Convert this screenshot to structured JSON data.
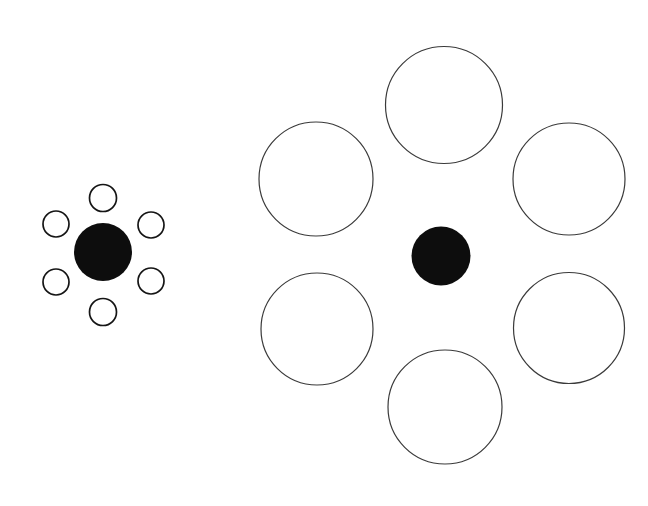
{
  "figure": {
    "name": "ebbinghaus-illusion",
    "canvas": {
      "width": 648,
      "height": 506
    },
    "colors": {
      "background": "#ffffff",
      "target_fill": "#0d0d0d",
      "inducer_stroke_small": "#151515",
      "inducer_stroke_large": "#3a3a3a",
      "inducer_fill": "#ffffff"
    },
    "stroke_widths": {
      "small_inducer": 1.7,
      "large_inducer": 1.2
    }
  },
  "groups": [
    {
      "id": "left-group",
      "label": "Target surrounded by small circles",
      "target": {
        "label": "left-target-circle",
        "cx": 103,
        "cy": 252,
        "r": 29,
        "fill": "#0d0d0d"
      },
      "inducers": [
        {
          "label": "top",
          "cx": 103,
          "cy": 198,
          "r": 13.5
        },
        {
          "label": "upper-right",
          "cx": 151,
          "cy": 225,
          "r": 13.0
        },
        {
          "label": "lower-right",
          "cx": 151,
          "cy": 281,
          "r": 13.0
        },
        {
          "label": "bottom",
          "cx": 103,
          "cy": 312,
          "r": 13.5
        },
        {
          "label": "lower-left",
          "cx": 56,
          "cy": 282,
          "r": 13.0
        },
        {
          "label": "upper-left",
          "cx": 56,
          "cy": 224,
          "r": 13.0
        }
      ]
    },
    {
      "id": "right-group",
      "label": "Target surrounded by large circles",
      "target": {
        "label": "right-target-circle",
        "cx": 441,
        "cy": 256,
        "r": 29.5,
        "fill": "#0d0d0d"
      },
      "inducers": [
        {
          "label": "top",
          "cx": 444,
          "cy": 105,
          "r": 58.5
        },
        {
          "label": "upper-right",
          "cx": 569,
          "cy": 179,
          "r": 56.0
        },
        {
          "label": "lower-right",
          "cx": 569,
          "cy": 328,
          "r": 55.5
        },
        {
          "label": "bottom",
          "cx": 445,
          "cy": 407,
          "r": 57.0
        },
        {
          "label": "lower-left",
          "cx": 317,
          "cy": 329,
          "r": 56.0
        },
        {
          "label": "upper-left",
          "cx": 316,
          "cy": 179,
          "r": 57.0
        }
      ]
    }
  ]
}
